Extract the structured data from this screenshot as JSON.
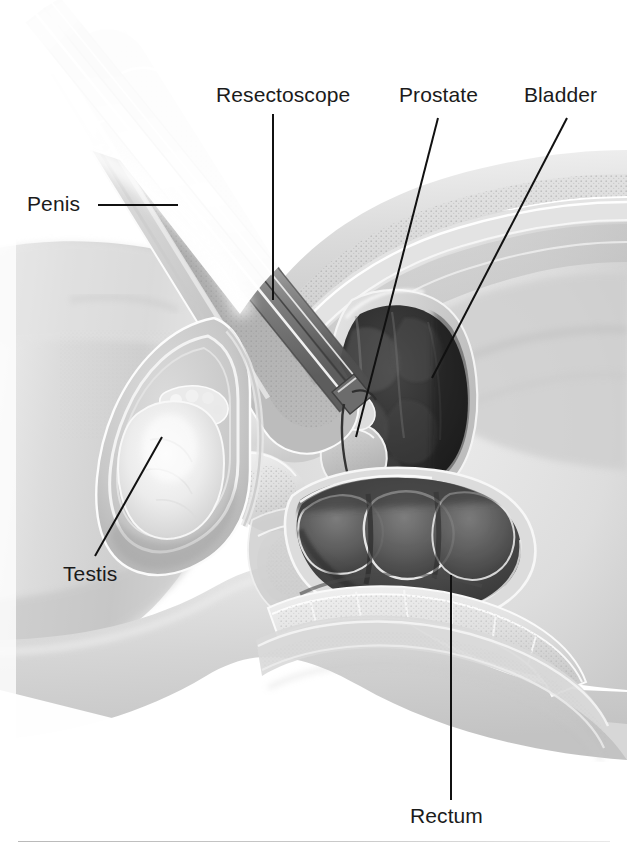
{
  "figure": {
    "type": "medical-anatomical-illustration",
    "style": "grayscale airbrush medical illustration",
    "width": 627,
    "height": 852,
    "background_color": "#ffffff",
    "rule_color": "#c2c2c2"
  },
  "labels": {
    "penis": "Penis",
    "resectoscope": "Resectoscope",
    "prostate": "Prostate",
    "bladder": "Bladder",
    "testis": "Testis",
    "rectum": "Rectum"
  },
  "label_style": {
    "font_size_px": 21,
    "text_color": "#1b1b1b",
    "leader_color": "#111111",
    "leader_width_px": 2
  },
  "leaders": {
    "penis": {
      "x1": 98,
      "y1": 205,
      "x2": 178,
      "y2": 205
    },
    "resectoscope": {
      "x1": 273,
      "y1": 114,
      "x2": 273,
      "y2": 300
    },
    "prostate": {
      "x1": 438,
      "y1": 118,
      "x2": 356,
      "y2": 437
    },
    "bladder": {
      "x1": 567,
      "y1": 118,
      "x2": 432,
      "y2": 378
    },
    "testis": {
      "x1": 95,
      "y1": 556,
      "x2": 162,
      "y2": 437
    },
    "rectum": {
      "x1": 451,
      "y1": 575,
      "x2": 451,
      "y2": 800
    }
  },
  "structures": [
    {
      "name": "abdominal-wall",
      "tone": "#d6d6d6"
    },
    {
      "name": "subcutaneous-fat",
      "tone": "#cfcfcf"
    },
    {
      "name": "bladder-lumen",
      "tone": "#2e2e2e"
    },
    {
      "name": "bladder-wall",
      "tone": "#cccccc"
    },
    {
      "name": "prostate",
      "tone": "#c4c4c4"
    },
    {
      "name": "penis-shaft",
      "tone": "#c7c7c7"
    },
    {
      "name": "corpus-cavernosum",
      "tone": "#a9a9a9"
    },
    {
      "name": "urethra",
      "tone": "#9a9a9a"
    },
    {
      "name": "resectoscope-sheath",
      "tone": "#8e8e8e"
    },
    {
      "name": "resectoscope-highlight",
      "tone": "#fdfdfd"
    },
    {
      "name": "scrotum",
      "tone": "#c2c2c2"
    },
    {
      "name": "testis",
      "tone": "#ececec"
    },
    {
      "name": "rectum-lumen",
      "tone": "#4a4a4a"
    },
    {
      "name": "sacrum-vertebrae",
      "tone": "#dcdcdc"
    },
    {
      "name": "thigh",
      "tone": "#d9d9d9"
    },
    {
      "name": "pubic-bone",
      "tone": "#e4e4e4"
    }
  ]
}
